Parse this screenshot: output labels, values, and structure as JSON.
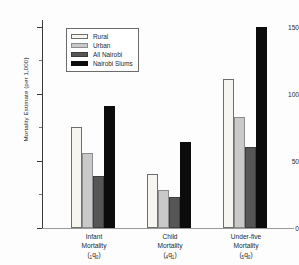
{
  "chart_data": {
    "type": "bar",
    "title": "",
    "xlabel": "",
    "ylabel": "Mortality Estimate (per 1,000)",
    "ylim": [
      0,
      155
    ],
    "yticks": [
      0,
      50,
      100,
      150
    ],
    "ytick_labels": [
      "0",
      "50",
      "100",
      "150"
    ],
    "yminor_ticks": [
      25,
      75,
      125
    ],
    "grid": false,
    "legend_position": "upper-left-inside",
    "categories": [
      "Infant Mortality",
      "Child Mortality",
      "Under-five Mortality"
    ],
    "category_symbols": [
      "(1q0)",
      "(4q1)",
      "(5q0)"
    ],
    "category_lines": [
      [
        "Infant",
        "Mortality",
        "1q0"
      ],
      [
        "Child",
        "Mortality",
        "4q1"
      ],
      [
        "Under-five",
        "Mortality",
        "5q0"
      ]
    ],
    "series": [
      {
        "name": "Rural",
        "color": "#f6f5ef",
        "values": [
          75,
          40,
          111
        ]
      },
      {
        "name": "Urban",
        "color": "#c9c9c9",
        "values": [
          56,
          28,
          83
        ]
      },
      {
        "name": "All Nairobi",
        "color": "#565656",
        "values": [
          39,
          23,
          60
        ]
      },
      {
        "name": "Nairobi Slums",
        "color": "#0c0c0c",
        "values": [
          91,
          64,
          150
        ]
      }
    ]
  },
  "legend": {
    "items": [
      {
        "label": "Rural"
      },
      {
        "label": "Urban"
      },
      {
        "label": "All Nairobi"
      },
      {
        "label": "Nairobi Slums"
      }
    ]
  },
  "axes": {
    "y_title": "Mortality Estimate (per 1,000)",
    "y_labels": [
      "150",
      "100",
      "50",
      "0"
    ]
  },
  "categories": [
    {
      "line1": "Infant",
      "line2": "Mortality",
      "q_left": "1",
      "q_right": "0"
    },
    {
      "line1": "Child",
      "line2": "Mortality",
      "q_left": "4",
      "q_right": "1"
    },
    {
      "line1": "Under-five",
      "line2": "Mortality",
      "q_left": "5",
      "q_right": "0"
    }
  ]
}
